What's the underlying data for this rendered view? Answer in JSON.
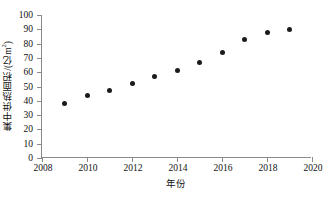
{
  "chart_data": {
    "type": "scatter",
    "title": "",
    "xlabel": "年份",
    "ylabel": "集中供热面积/(亿m",
    "ylabel_sup": "2",
    "ylabel_tail": ")",
    "x": [
      2009,
      2010,
      2011,
      2012,
      2013,
      2014,
      2015,
      2016,
      2017,
      2018,
      2019
    ],
    "values": [
      38,
      43.5,
      47,
      52,
      57,
      61,
      67,
      73.5,
      83,
      87.5,
      90
    ],
    "xlim": [
      2008,
      2020
    ],
    "ylim": [
      0,
      100
    ],
    "xticks": [
      "2008",
      "2010",
      "2012",
      "2014",
      "2016",
      "2018",
      "2020"
    ],
    "xtick_values": [
      2008,
      2010,
      2012,
      2014,
      2016,
      2018,
      2020
    ],
    "yticks": [
      "0",
      "10",
      "20",
      "30",
      "40",
      "50",
      "60",
      "70",
      "80",
      "90",
      "100"
    ],
    "ytick_values": [
      0,
      10,
      20,
      30,
      40,
      50,
      60,
      70,
      80,
      90,
      100
    ],
    "grid": false,
    "legend": null,
    "marker_color": "#1b1b1b",
    "axis_color": "#8a8a8a"
  }
}
